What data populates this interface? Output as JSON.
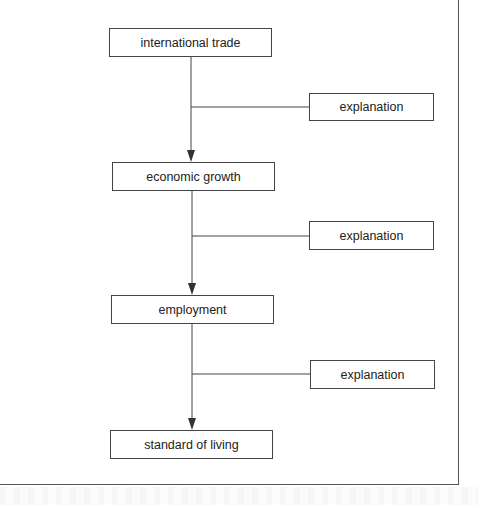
{
  "diagram": {
    "type": "flowchart",
    "nodes": [
      {
        "id": "n1",
        "label": "international trade"
      },
      {
        "id": "n2",
        "label": "economic growth"
      },
      {
        "id": "n3",
        "label": "employment"
      },
      {
        "id": "n4",
        "label": "standard of living"
      }
    ],
    "explanations": [
      {
        "id": "e1",
        "label": "explanation",
        "links": "n1->n2"
      },
      {
        "id": "e2",
        "label": "explanation",
        "links": "n2->n3"
      },
      {
        "id": "e3",
        "label": "explanation",
        "links": "n3->n4"
      }
    ],
    "edges": [
      {
        "from": "n1",
        "to": "n2"
      },
      {
        "from": "n2",
        "to": "n3"
      },
      {
        "from": "n3",
        "to": "n4"
      }
    ],
    "colors": {
      "line": "#444444",
      "text": "#222222",
      "background": "#ffffff"
    }
  }
}
